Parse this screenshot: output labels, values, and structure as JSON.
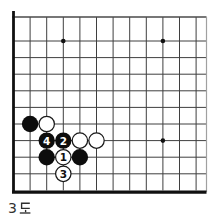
{
  "caption": {
    "text": "3도",
    "digit": "3",
    "hangul": "도"
  },
  "board": {
    "background": "#ffffff",
    "line_color": "#3f3f3f",
    "edge_color": "#101010",
    "top_border_color": "#4a4a4a",
    "right_border_color": "#a0a0a0",
    "star_color": "#111111",
    "black_stone_color": "#0d0d0d",
    "white_stone_color": "#ffffff",
    "stone_outline_color": "#1a1a1a",
    "grid": {
      "cols": 12,
      "rows": 10,
      "origin_x": 13.5,
      "origin_y": 41,
      "spacing_x": 16.6,
      "spacing_y": 16.6,
      "top_crop_y": 17,
      "right_crop_x": 206.5,
      "left_edge_top_y": 11
    },
    "star_points": [
      {
        "col": 4,
        "row": 1
      },
      {
        "col": 10,
        "row": 1
      },
      {
        "col": 10,
        "row": 7
      }
    ],
    "stones": [
      {
        "col": 2,
        "row": 6,
        "color": "black",
        "label": ""
      },
      {
        "col": 3,
        "row": 6,
        "color": "white",
        "label": ""
      },
      {
        "col": 3,
        "row": 7,
        "color": "black",
        "label": "4"
      },
      {
        "col": 4,
        "row": 7,
        "color": "black",
        "label": "2"
      },
      {
        "col": 5,
        "row": 7,
        "color": "white",
        "label": ""
      },
      {
        "col": 6,
        "row": 7,
        "color": "white",
        "label": ""
      },
      {
        "col": 3,
        "row": 8,
        "color": "black",
        "label": ""
      },
      {
        "col": 4,
        "row": 8,
        "color": "white",
        "label": "1"
      },
      {
        "col": 5,
        "row": 8,
        "color": "black",
        "label": ""
      },
      {
        "col": 4,
        "row": 9,
        "color": "white",
        "label": "3"
      }
    ]
  }
}
